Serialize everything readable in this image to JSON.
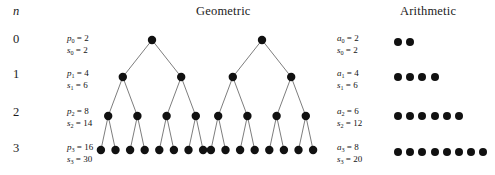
{
  "headers": {
    "n_label": "n",
    "geometric": "Geometric",
    "arithmetic": "Arithmetic"
  },
  "rows": [
    {
      "n": "0",
      "geometric": {
        "p_label": "p",
        "p_sub": "0",
        "p_value": "2",
        "s_label": "s",
        "s_sub": "0",
        "s_value": "2",
        "nodes_at_level": 1,
        "tree_level": 0
      },
      "arithmetic": {
        "a_label": "a",
        "a_sub": "0",
        "a_value": "2",
        "s_label": "s",
        "s_sub": "0",
        "s_value": "2",
        "dot_count": 2
      }
    },
    {
      "n": "1",
      "geometric": {
        "p_label": "p",
        "p_sub": "1",
        "p_value": "4",
        "s_label": "s",
        "s_sub": "1",
        "s_value": "6",
        "nodes_at_level": 2,
        "tree_level": 1
      },
      "arithmetic": {
        "a_label": "a",
        "a_sub": "1",
        "a_value": "4",
        "s_label": "s",
        "s_sub": "1",
        "s_value": "6",
        "dot_count": 4
      }
    },
    {
      "n": "2",
      "geometric": {
        "p_label": "p",
        "p_sub": "2",
        "p_value": "8",
        "s_label": "s",
        "s_sub": "2",
        "s_value": "14",
        "nodes_at_level": 4,
        "tree_level": 2
      },
      "arithmetic": {
        "a_label": "a",
        "a_sub": "2",
        "a_value": "6",
        "s_label": "s",
        "s_sub": "2",
        "s_value": "12",
        "dot_count": 6
      }
    },
    {
      "n": "3",
      "geometric": {
        "p_label": "p",
        "p_sub": "3",
        "p_value": "16",
        "s_label": "s",
        "s_sub": "3",
        "s_value": "30",
        "nodes_at_level": 8,
        "tree_level": 3
      },
      "arithmetic": {
        "a_label": "a",
        "a_sub": "3",
        "a_value": "8",
        "s_label": "s",
        "s_sub": "3",
        "s_value": "20",
        "dot_count": 8
      }
    }
  ],
  "trees": {
    "count": 2,
    "depth": 4,
    "node_color": "#111111",
    "edge_color": "#6e6e6e",
    "roots_x": [
      152,
      262
    ],
    "level_y": [
      40,
      77,
      116,
      150
    ],
    "leaf_spacing": 14.6,
    "node_radius": 4.2
  },
  "equals": "=",
  "layout": {
    "row_y": [
      38,
      72,
      112,
      148
    ],
    "formula_y": [
      33,
      68,
      106,
      142
    ],
    "dot_row_x": 394,
    "dot_row_y": [
      38,
      73,
      112,
      148
    ]
  }
}
